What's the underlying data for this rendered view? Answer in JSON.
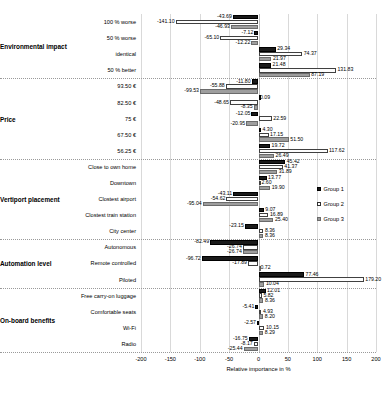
{
  "chart_data": {
    "type": "bar",
    "orientation": "horizontal",
    "title": "",
    "xlabel": "Relative importance in %",
    "ylabel": "",
    "xlim": [
      -200,
      200
    ],
    "xticks": [
      -200,
      -150,
      -100,
      -50,
      0,
      50,
      100,
      150,
      200
    ],
    "grid": true,
    "legend_position": "right",
    "legend": [
      "Group 1",
      "Group 2",
      "Group 3"
    ],
    "series_colors": [
      "#1a1a1a",
      "#ffffff",
      "#9e9e9e"
    ],
    "attribute_groups": [
      "Environmental impact",
      "Price",
      "Vertiport placement",
      "Automation level",
      "On-board benefits"
    ],
    "categories": [
      "100 % worse",
      "50 % worse",
      "identical",
      "50 % better",
      "93.50 €",
      "82.50 €",
      "75 €",
      "67.50 €",
      "56.25 €",
      "Close to own home",
      "Downtown",
      "Clostest airport",
      "Clostest train station",
      "City center",
      "Autonomous",
      "Remote controlled",
      "Piloted",
      "Free carry-on luggage",
      "Comfortable seats",
      "Wi-Fi",
      "Radio"
    ],
    "series": [
      {
        "name": "Group 1",
        "values": [
          -43.69,
          -7.12,
          29.34,
          21.48,
          -11.8,
          0.09,
          -12.05,
          4.3,
          19.72,
          45.42,
          13.77,
          -43.11,
          9.07,
          -23.15,
          -82.49,
          -96.72,
          77.46,
          12.01,
          -5.41,
          -2.57,
          -16.75
        ]
      },
      {
        "name": "Group 2",
        "values": [
          -141.1,
          -65.1,
          74.37,
          131.83,
          -55.88,
          -48.65,
          22.59,
          17.15,
          117.62,
          41.37,
          2.6,
          -54.62,
          16.89,
          8.36,
          -26.74,
          -17.89,
          179.2,
          5.82,
          4.93,
          10.15,
          -8.17
        ]
      },
      {
        "name": "Group 3",
        "values": [
          -46.93,
          -12.22,
          21.97,
          87.19,
          -99.53,
          -8.35,
          -20.95,
          51.5,
          26.49,
          31.89,
          19.9,
          -95.04,
          25.4,
          8.36,
          -26.74,
          0.72,
          10.04,
          8.36,
          8.2,
          8.29,
          -25.44
        ]
      }
    ],
    "group_row_ranges": [
      {
        "group": "Environmental impact",
        "start": 0,
        "end": 3
      },
      {
        "group": "Price",
        "start": 4,
        "end": 8
      },
      {
        "group": "Vertiport placement",
        "start": 9,
        "end": 13
      },
      {
        "group": "Automation level",
        "start": 14,
        "end": 16
      },
      {
        "group": "On-board benefits",
        "start": 17,
        "end": 20
      }
    ]
  }
}
